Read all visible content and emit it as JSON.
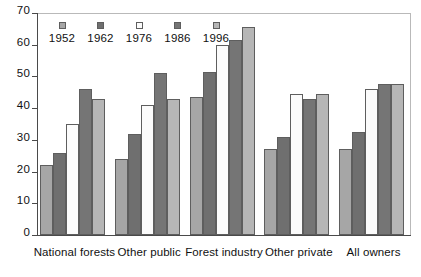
{
  "chart_data": {
    "type": "bar",
    "title": "",
    "xlabel": "",
    "ylabel": "",
    "ylim": [
      0,
      70
    ],
    "ytick_step": 10,
    "yticks": [
      "0",
      "10",
      "20",
      "30",
      "40",
      "50",
      "60",
      "70"
    ],
    "grid": false,
    "legend_position": "top-left-inside",
    "categories": [
      "National forests",
      "Other public",
      "Forest industry",
      "Other private",
      "All owners"
    ],
    "series": [
      {
        "name": "1952",
        "color": "#a6a6a6",
        "values": [
          22,
          24,
          43.5,
          27,
          27
        ]
      },
      {
        "name": "1962",
        "color": "#6f6f6f",
        "values": [
          26,
          32,
          51.5,
          31,
          32.5
        ]
      },
      {
        "name": "1976",
        "color": "#fbfbfb",
        "values": [
          35,
          41,
          60,
          44.5,
          46
        ]
      },
      {
        "name": "1986",
        "color": "#757575",
        "values": [
          46,
          51,
          61.5,
          43,
          47.5
        ]
      },
      {
        "name": "1996",
        "color": "#b6b6b6",
        "values": [
          43,
          43,
          65.5,
          44.5,
          47.5
        ]
      }
    ]
  }
}
